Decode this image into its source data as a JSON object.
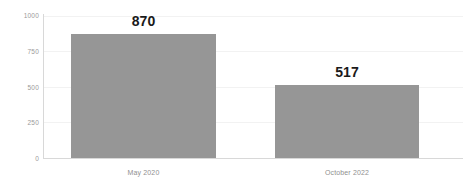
{
  "chart_data": {
    "type": "bar",
    "title": "",
    "subtitle": "",
    "xlabel": "",
    "ylabel": "",
    "categories": [
      "May 2020",
      "October 2022"
    ],
    "values": [
      870,
      517
    ],
    "data_labels": [
      "870",
      "517"
    ],
    "ylim": [
      0,
      1000
    ],
    "ytick_labels": [
      "1000",
      "750",
      "500",
      "250",
      "0"
    ],
    "ytick_values": [
      1000,
      750,
      500,
      250,
      0
    ],
    "grid": true,
    "grid_axis": "y",
    "legend": false,
    "legend_position": "none",
    "bar_color": "#969696",
    "gridline_color": "#f2f2f2",
    "axis_color": "#d8d8d8",
    "tick_label_color": "#9a9a9a",
    "category_label_color": "#8f8f8f",
    "data_label_color": "#1a1a1a",
    "background_color": "#ffffff"
  }
}
